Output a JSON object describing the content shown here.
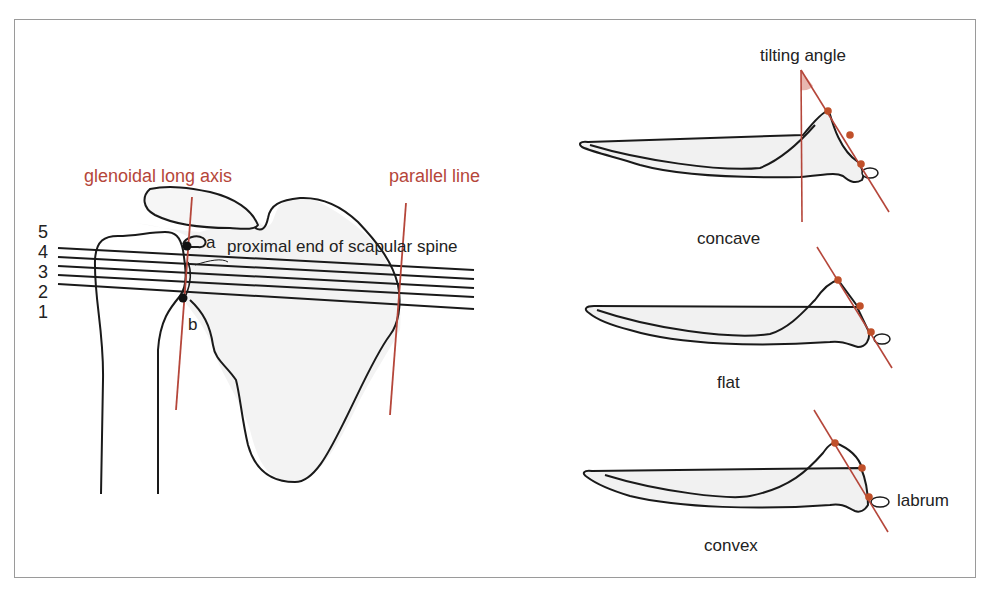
{
  "figure": {
    "left_panel": {
      "axis_label": "glenoidal long axis",
      "parallel_label": "parallel line",
      "spine_label": "proximal end of scapular spine",
      "point_a": "a",
      "point_b": "b",
      "line_numbers": [
        "5",
        "4",
        "3",
        "2",
        "1"
      ]
    },
    "right_panel": {
      "angle_label": "tilting angle",
      "profiles": [
        {
          "label": "concave"
        },
        {
          "label": "flat"
        },
        {
          "label": "convex"
        }
      ],
      "labrum_label": "labrum"
    },
    "colors": {
      "outline": "#1a1a1a",
      "axis_red": "#b5463a",
      "dot_red": "#c0502a",
      "bone_fill": "#f1f1f1",
      "frame": "#9a9a9a",
      "angle_fill": "#e8b7b0"
    }
  }
}
